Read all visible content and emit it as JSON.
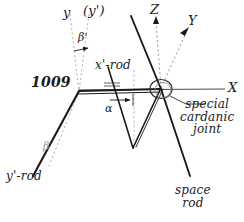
{
  "figure": {
    "colors": {
      "stroke_solid": "#1a1a1a",
      "stroke_dashed": "#b0b0b0",
      "stroke_axis": "#555555",
      "text": "#1a1a1a",
      "text_faint": "#9a9a9a",
      "background": "#ffffff"
    }
  },
  "axes": {
    "x": {
      "label": "X",
      "style": "solid"
    },
    "y": {
      "label": "Y",
      "style": "dashed-arrow"
    },
    "z": {
      "label": "Z",
      "style": "dashed-arrow"
    },
    "y_local": {
      "label": "y",
      "style": "dashed"
    },
    "y_prime_local": {
      "label": "(y')",
      "style": "dashed"
    }
  },
  "angles": {
    "alpha": "α",
    "beta": "β",
    "beta_prime": "β'"
  },
  "parts": {
    "x_prime_rod": "x'-rod",
    "y_prime_rod": "y'-rod",
    "space_rod": {
      "line1": "space",
      "line2": "rod"
    },
    "joint": {
      "line1": "special",
      "line2": "cardanic",
      "line3": "joint"
    }
  },
  "annotations": {
    "part_number": "1009"
  }
}
